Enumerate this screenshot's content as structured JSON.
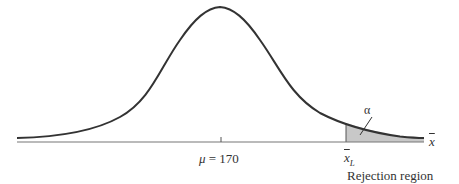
{
  "diagram": {
    "type": "normal-distribution-rejection-region",
    "mean_label": "μ = 170",
    "mean_symbol": "μ",
    "mean_value": "= 170",
    "critical_value_label": "x̄L",
    "critical_value_symbol": "x",
    "critical_value_subscript": "L",
    "axis_label": "x",
    "alpha_label": "α",
    "rejection_region_label": "Rejection region",
    "colors": {
      "curve": "#333333",
      "axis": "#555555",
      "shading": "#c8c8c8",
      "text": "#333333"
    }
  }
}
